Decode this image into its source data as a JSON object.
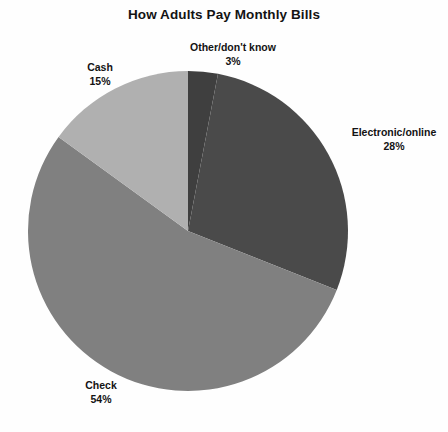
{
  "chart_data": {
    "type": "pie",
    "title": "How Adults Pay Monthly Bills",
    "categories": [
      "Other/don't know",
      "Electronic/online",
      "Check",
      "Cash"
    ],
    "values": [
      3,
      28,
      54,
      15
    ],
    "value_unit": "%",
    "labels": [
      {
        "name": "Other/don't know",
        "value": 3,
        "value_text": "3%",
        "color": "#3f3f3f"
      },
      {
        "name": "Electronic/online",
        "value": 28,
        "value_text": "28%",
        "color": "#4a4a4a"
      },
      {
        "name": "Check",
        "value": 54,
        "value_text": "54%",
        "color": "#808080"
      },
      {
        "name": "Cash",
        "value": 15,
        "value_text": "15%",
        "color": "#b0b0b0"
      }
    ],
    "start_angle_deg": 0,
    "direction": "clockwise",
    "legend": "none",
    "grid": false,
    "xlabel": "",
    "ylabel": "",
    "background": "#fefefe"
  },
  "geometry": {
    "center_x": 188,
    "center_y": 231,
    "radius": 160
  }
}
